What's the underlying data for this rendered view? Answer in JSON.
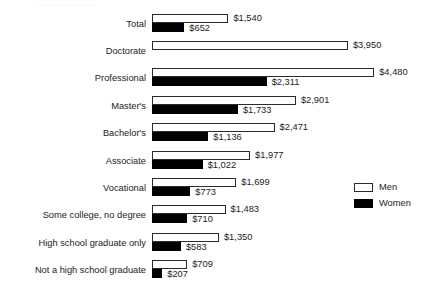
{
  "top_remnant_text": "........................",
  "legend": {
    "men_label": "Men",
    "women_label": "Women",
    "men_color": "#ffffff",
    "women_color": "#000000",
    "outline_color": "#2a2a2a"
  },
  "chart_data": {
    "type": "bar",
    "orientation": "horizontal",
    "title": "",
    "xlabel": "",
    "ylabel": "",
    "grid": false,
    "legend_position": "right",
    "xlim": [
      0,
      4480
    ],
    "px_per_unit": 0.0496,
    "baseline_x_px": 152,
    "value_prefix": "$",
    "categories": [
      "Total",
      "Doctorate",
      "Professional",
      "Master's",
      "Bachelor's",
      "Associate",
      "Vocational",
      "Some college, no degree",
      "High school graduate only",
      "Not a high school graduate"
    ],
    "series": [
      {
        "name": "Men",
        "values": [
          1540,
          3950,
          4480,
          2901,
          2471,
          1977,
          1699,
          1483,
          1350,
          709
        ],
        "labels": [
          "$1,540",
          "$3,950",
          "$4,480",
          "$2,901",
          "$2,471",
          "$1,977",
          "$1,699",
          "$1,483",
          "$1,350",
          "$709"
        ]
      },
      {
        "name": "Women",
        "values": [
          652,
          null,
          2311,
          1733,
          1136,
          1022,
          773,
          710,
          583,
          207
        ],
        "labels": [
          "$652",
          "",
          "$2,311",
          "$1,733",
          "$1,136",
          "$1,022",
          "$773",
          "$710",
          "$583",
          "$207"
        ]
      }
    ]
  }
}
